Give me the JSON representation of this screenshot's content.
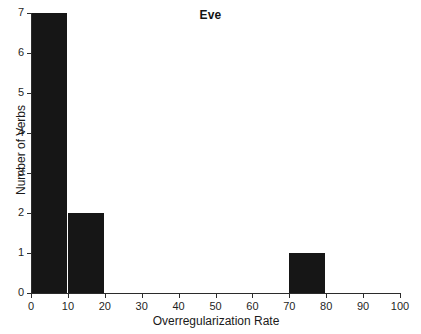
{
  "chart_data": {
    "type": "bar",
    "title": "Eve",
    "xlabel": "Overregularization Rate",
    "ylabel": "Number of Verbs",
    "xlim": [
      0,
      100
    ],
    "ylim": [
      0,
      7
    ],
    "grid": false,
    "legend": null,
    "bar_color": "#161616",
    "axis_color": "#2b2b2b",
    "background": "#ffffff",
    "bin_width": 10,
    "categories": [
      "0-10",
      "10-20",
      "20-30",
      "30-40",
      "40-50",
      "50-60",
      "60-70",
      "70-80",
      "80-90",
      "90-100"
    ],
    "bins": [
      {
        "start": 0,
        "end": 10,
        "value": 7
      },
      {
        "start": 10,
        "end": 20,
        "value": 2
      },
      {
        "start": 20,
        "end": 30,
        "value": 0
      },
      {
        "start": 30,
        "end": 40,
        "value": 0
      },
      {
        "start": 40,
        "end": 50,
        "value": 0
      },
      {
        "start": 50,
        "end": 60,
        "value": 0
      },
      {
        "start": 60,
        "end": 70,
        "value": 0
      },
      {
        "start": 70,
        "end": 80,
        "value": 1
      },
      {
        "start": 80,
        "end": 90,
        "value": 0
      },
      {
        "start": 90,
        "end": 100,
        "value": 0
      }
    ],
    "values": [
      7,
      2,
      0,
      0,
      0,
      0,
      0,
      1,
      0,
      0
    ],
    "x_ticks": [
      {
        "value": 0,
        "label": "0"
      },
      {
        "value": 10,
        "label": "10"
      },
      {
        "value": 20,
        "label": "20"
      },
      {
        "value": 30,
        "label": "30"
      },
      {
        "value": 40,
        "label": "40"
      },
      {
        "value": 50,
        "label": "50"
      },
      {
        "value": 60,
        "label": "60"
      },
      {
        "value": 70,
        "label": "70"
      },
      {
        "value": 80,
        "label": "80"
      },
      {
        "value": 90,
        "label": "90"
      },
      {
        "value": 100,
        "label": "100"
      }
    ],
    "y_ticks": [
      {
        "value": 0,
        "label": "0"
      },
      {
        "value": 1,
        "label": "1"
      },
      {
        "value": 2,
        "label": "2"
      },
      {
        "value": 3,
        "label": "3"
      },
      {
        "value": 4,
        "label": "4"
      },
      {
        "value": 5,
        "label": "5"
      },
      {
        "value": 6,
        "label": "6"
      },
      {
        "value": 7,
        "label": "7"
      }
    ]
  }
}
